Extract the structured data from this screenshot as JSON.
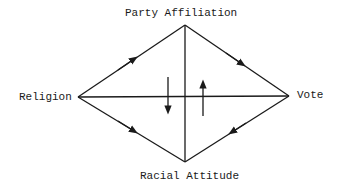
{
  "diagram": {
    "nodes": [
      {
        "id": "party",
        "label": "Party Affiliation"
      },
      {
        "id": "religion",
        "label": "Religion"
      },
      {
        "id": "vote",
        "label": "Vote"
      },
      {
        "id": "racial",
        "label": "Racial Attitude"
      }
    ],
    "edges": [
      {
        "from": "religion",
        "to": "party",
        "directed": true
      },
      {
        "from": "party",
        "to": "vote",
        "directed": true
      },
      {
        "from": "religion",
        "to": "racial",
        "directed": true
      },
      {
        "from": "vote",
        "to": "racial",
        "directed": true
      },
      {
        "from": "religion",
        "to": "vote",
        "directed": false
      },
      {
        "from": "party",
        "to": "racial",
        "directed": false
      }
    ],
    "flow_arrows": [
      {
        "direction": "down",
        "side": "left of center"
      },
      {
        "direction": "up",
        "side": "right of center"
      }
    ],
    "colors": {
      "line": "#1a1a1a",
      "background": "#ffffff"
    }
  }
}
